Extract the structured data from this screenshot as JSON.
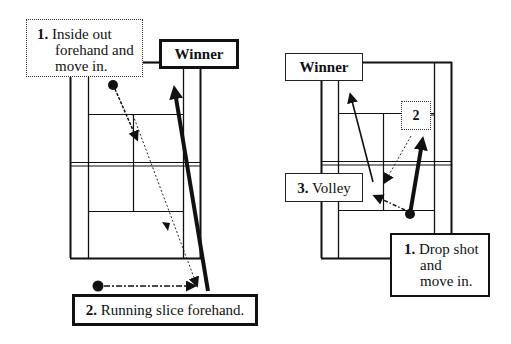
{
  "diagrams": [
    {
      "id": "left",
      "labels": {
        "step1_num": "1.",
        "step1_line1": "Inside out",
        "step1_line2": "forehand and",
        "step1_line3": "move in.",
        "winner": "Winner",
        "step2_num": "2.",
        "step2_text": "Running slice forehand."
      }
    },
    {
      "id": "right",
      "labels": {
        "winner": "Winner",
        "step2": "2",
        "step3_num": "3.",
        "step3_text": "Volley",
        "step1_num": "1.",
        "step1_line1": "Drop shot",
        "step1_line2": "and",
        "step1_line3": "move in."
      }
    }
  ],
  "colors": {
    "line": "#111111",
    "background": "#ffffff"
  }
}
